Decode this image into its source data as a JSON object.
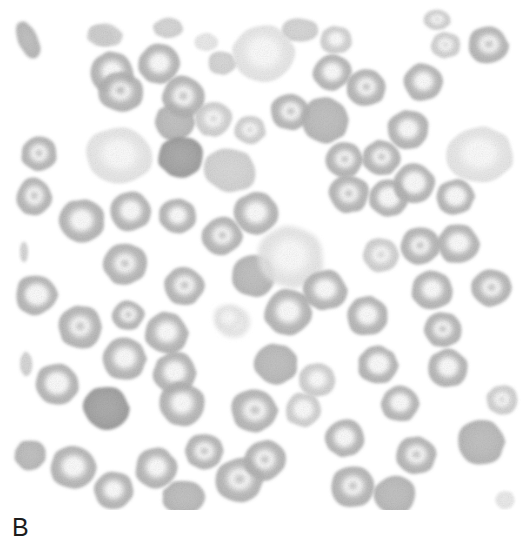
{
  "figure": {
    "panel_label": "B",
    "image_kind": "blood-smear-micrograph",
    "background_color": "#ffffff",
    "canvas": {
      "width": 530,
      "height": 510
    },
    "label_color": "#1c1c1c",
    "alt_text": "B"
  },
  "palette": {
    "background": "#ffffff",
    "cell_dark": "#9a9a9a",
    "cell_mid": "#b4b4b4",
    "cell_light": "#cfcfcf",
    "cell_pale": "#e6e6e6",
    "pallor_center": "#fbfbfb",
    "rim_shadow": "#8f8f8f"
  },
  "cells": [
    {
      "cx": 28,
      "cy": 40,
      "rx": 10,
      "ry": 20,
      "rot": -25,
      "tone": "mid",
      "pallor": 0.05,
      "kind": "fragment"
    },
    {
      "cx": 101,
      "cy": 36,
      "rx": 14,
      "ry": 10,
      "rot": 10,
      "tone": "light",
      "pallor": 0.1,
      "kind": "fragment"
    },
    {
      "cx": 112,
      "cy": 72,
      "rx": 22,
      "ry": 21,
      "rot": 0,
      "tone": "mid",
      "pallor": 0.6,
      "kind": "discocyte"
    },
    {
      "cx": 119,
      "cy": 156,
      "rx": 33,
      "ry": 28,
      "rot": 8,
      "tone": "pale",
      "pallor": 0.82,
      "kind": "hypochromic"
    },
    {
      "cx": 39,
      "cy": 154,
      "rx": 18,
      "ry": 17,
      "rot": 0,
      "tone": "mid",
      "pallor": 0.55,
      "kind": "discocyte"
    },
    {
      "cx": 34,
      "cy": 197,
      "rx": 18,
      "ry": 19,
      "rot": 0,
      "tone": "mid",
      "pallor": 0.55,
      "kind": "discocyte"
    },
    {
      "cx": 82,
      "cy": 221,
      "rx": 23,
      "ry": 22,
      "rot": 0,
      "tone": "mid",
      "pallor": 0.72,
      "kind": "discocyte"
    },
    {
      "cx": 130,
      "cy": 211,
      "rx": 21,
      "ry": 20,
      "rot": 0,
      "tone": "mid",
      "pallor": 0.7,
      "kind": "discocyte"
    },
    {
      "cx": 178,
      "cy": 216,
      "rx": 19,
      "ry": 18,
      "rot": 0,
      "tone": "mid",
      "pallor": 0.58,
      "kind": "discocyte"
    },
    {
      "cx": 125,
      "cy": 264,
      "rx": 22,
      "ry": 21,
      "rot": 0,
      "tone": "mid",
      "pallor": 0.45,
      "kind": "discocyte"
    },
    {
      "cx": 36,
      "cy": 295,
      "rx": 21,
      "ry": 20,
      "rot": 0,
      "tone": "mid",
      "pallor": 0.8,
      "kind": "annulocyte"
    },
    {
      "cx": 80,
      "cy": 327,
      "rx": 22,
      "ry": 22,
      "rot": 0,
      "tone": "mid",
      "pallor": 0.5,
      "kind": "discocyte"
    },
    {
      "cx": 128,
      "cy": 315,
      "rx": 16,
      "ry": 15,
      "rot": 0,
      "tone": "mid",
      "pallor": 0.52,
      "kind": "keratocyte"
    },
    {
      "cx": 24,
      "cy": 252,
      "rx": 4,
      "ry": 10,
      "rot": 0,
      "tone": "light",
      "pallor": 0.05,
      "kind": "fragment"
    },
    {
      "cx": 124,
      "cy": 359,
      "rx": 22,
      "ry": 21,
      "rot": 0,
      "tone": "mid",
      "pallor": 0.65,
      "kind": "discocyte"
    },
    {
      "cx": 175,
      "cy": 373,
      "rx": 22,
      "ry": 21,
      "rot": 0,
      "tone": "mid",
      "pallor": 0.62,
      "kind": "discocyte"
    },
    {
      "cx": 26,
      "cy": 364,
      "rx": 6,
      "ry": 12,
      "rot": 0,
      "tone": "light",
      "pallor": 0.05,
      "kind": "fragment"
    },
    {
      "cx": 57,
      "cy": 384,
      "rx": 22,
      "ry": 21,
      "rot": 0,
      "tone": "mid",
      "pallor": 0.82,
      "kind": "annulocyte"
    },
    {
      "cx": 106,
      "cy": 408,
      "rx": 23,
      "ry": 22,
      "rot": 0,
      "tone": "dark",
      "pallor": 0.18,
      "kind": "discocyte"
    },
    {
      "cx": 30,
      "cy": 455,
      "rx": 16,
      "ry": 15,
      "rot": 0,
      "tone": "mid",
      "pallor": 0.3,
      "kind": "fragment"
    },
    {
      "cx": 73,
      "cy": 467,
      "rx": 23,
      "ry": 22,
      "rot": 0,
      "tone": "mid",
      "pallor": 0.7,
      "kind": "discocyte"
    },
    {
      "cx": 114,
      "cy": 490,
      "rx": 20,
      "ry": 19,
      "rot": 0,
      "tone": "mid",
      "pallor": 0.58,
      "kind": "discocyte"
    },
    {
      "cx": 156,
      "cy": 468,
      "rx": 21,
      "ry": 20,
      "rot": 0,
      "tone": "mid",
      "pallor": 0.6,
      "kind": "discocyte"
    },
    {
      "cx": 121,
      "cy": 92,
      "rx": 23,
      "ry": 20,
      "rot": 0,
      "tone": "mid",
      "pallor": 0.48,
      "kind": "discocyte"
    },
    {
      "cx": 175,
      "cy": 122,
      "rx": 20,
      "ry": 19,
      "rot": 0,
      "tone": "mid",
      "pallor": 0.35,
      "kind": "discocyte"
    },
    {
      "cx": 106,
      "cy": 35,
      "rx": 17,
      "ry": 11,
      "rot": 12,
      "tone": "light",
      "pallor": 0.08,
      "kind": "fragment"
    },
    {
      "cx": 159,
      "cy": 64,
      "rx": 21,
      "ry": 20,
      "rot": 0,
      "tone": "mid",
      "pallor": 0.62,
      "kind": "discocyte"
    },
    {
      "cx": 184,
      "cy": 97,
      "rx": 22,
      "ry": 21,
      "rot": 0,
      "tone": "mid",
      "pallor": 0.5,
      "kind": "discocyte"
    },
    {
      "cx": 213,
      "cy": 119,
      "rx": 19,
      "ry": 18,
      "rot": 0,
      "tone": "light",
      "pallor": 0.45,
      "kind": "discocyte"
    },
    {
      "cx": 181,
      "cy": 157,
      "rx": 23,
      "ry": 21,
      "rot": 0,
      "tone": "dark",
      "pallor": 0.2,
      "kind": "discocyte"
    },
    {
      "cx": 230,
      "cy": 170,
      "rx": 26,
      "ry": 22,
      "rot": 12,
      "tone": "light",
      "pallor": 0.35,
      "kind": "macrocyte"
    },
    {
      "cx": 222,
      "cy": 63,
      "rx": 14,
      "ry": 12,
      "rot": 0,
      "tone": "light",
      "pallor": 0.25,
      "kind": "fragment"
    },
    {
      "cx": 206,
      "cy": 42,
      "rx": 12,
      "ry": 9,
      "rot": 0,
      "tone": "pale",
      "pallor": 0.15,
      "kind": "fragment"
    },
    {
      "cx": 222,
      "cy": 236,
      "rx": 20,
      "ry": 19,
      "rot": 0,
      "tone": "mid",
      "pallor": 0.42,
      "kind": "discocyte"
    },
    {
      "cx": 253,
      "cy": 276,
      "rx": 22,
      "ry": 21,
      "rot": 0,
      "tone": "mid",
      "pallor": 0.28,
      "kind": "discocyte"
    },
    {
      "cx": 184,
      "cy": 286,
      "rx": 20,
      "ry": 19,
      "rot": 0,
      "tone": "mid",
      "pallor": 0.55,
      "kind": "discocyte"
    },
    {
      "cx": 233,
      "cy": 322,
      "rx": 17,
      "ry": 15,
      "rot": 0,
      "tone": "pale",
      "pallor": 0.85,
      "kind": "ghost"
    },
    {
      "cx": 166,
      "cy": 333,
      "rx": 22,
      "ry": 21,
      "rot": 0,
      "tone": "mid",
      "pallor": 0.6,
      "kind": "discocyte"
    },
    {
      "cx": 182,
      "cy": 404,
      "rx": 23,
      "ry": 22,
      "rot": 0,
      "tone": "mid",
      "pallor": 0.58,
      "kind": "discocyte"
    },
    {
      "cx": 204,
      "cy": 451,
      "rx": 19,
      "ry": 18,
      "rot": 0,
      "tone": "mid",
      "pallor": 0.55,
      "kind": "discocyte"
    },
    {
      "cx": 184,
      "cy": 497,
      "rx": 22,
      "ry": 17,
      "rot": 0,
      "tone": "mid",
      "pallor": 0.35,
      "kind": "discocyte"
    },
    {
      "cx": 239,
      "cy": 480,
      "rx": 24,
      "ry": 22,
      "rot": 0,
      "tone": "mid",
      "pallor": 0.55,
      "kind": "discocyte"
    },
    {
      "cx": 264,
      "cy": 53,
      "rx": 32,
      "ry": 28,
      "rot": 10,
      "tone": "pale",
      "pallor": 0.88,
      "kind": "hypochromic"
    },
    {
      "cx": 290,
      "cy": 112,
      "rx": 20,
      "ry": 18,
      "rot": 0,
      "tone": "mid",
      "pallor": 0.55,
      "kind": "discocyte"
    },
    {
      "cx": 250,
      "cy": 130,
      "rx": 16,
      "ry": 14,
      "rot": 0,
      "tone": "light",
      "pallor": 0.45,
      "kind": "fragment"
    },
    {
      "cx": 256,
      "cy": 213,
      "rx": 22,
      "ry": 21,
      "rot": 0,
      "tone": "mid",
      "pallor": 0.65,
      "kind": "discocyte"
    },
    {
      "cx": 290,
      "cy": 257,
      "rx": 34,
      "ry": 31,
      "rot": 0,
      "tone": "pale",
      "pallor": 0.92,
      "kind": "ghost"
    },
    {
      "cx": 288,
      "cy": 312,
      "rx": 24,
      "ry": 23,
      "rot": 0,
      "tone": "mid",
      "pallor": 0.62,
      "kind": "discocyte"
    },
    {
      "cx": 276,
      "cy": 364,
      "rx": 22,
      "ry": 20,
      "rot": 0,
      "tone": "mid",
      "pallor": 0.25,
      "kind": "discocyte"
    },
    {
      "cx": 303,
      "cy": 410,
      "rx": 18,
      "ry": 17,
      "rot": 0,
      "tone": "light",
      "pallor": 0.7,
      "kind": "annulocyte"
    },
    {
      "cx": 254,
      "cy": 410,
      "rx": 23,
      "ry": 22,
      "rot": 0,
      "tone": "mid",
      "pallor": 0.55,
      "kind": "discocyte"
    },
    {
      "cx": 265,
      "cy": 460,
      "rx": 21,
      "ry": 20,
      "rot": 0,
      "tone": "mid",
      "pallor": 0.5,
      "kind": "discocyte"
    },
    {
      "cx": 228,
      "cy": 318,
      "rx": 14,
      "ry": 13,
      "rot": 0,
      "tone": "pale",
      "pallor": 0.9,
      "kind": "ghost"
    },
    {
      "cx": 325,
      "cy": 120,
      "rx": 24,
      "ry": 23,
      "rot": 0,
      "tone": "mid",
      "pallor": 0.3,
      "kind": "discocyte"
    },
    {
      "cx": 332,
      "cy": 72,
      "rx": 19,
      "ry": 18,
      "rot": 0,
      "tone": "mid",
      "pallor": 0.6,
      "kind": "discocyte"
    },
    {
      "cx": 366,
      "cy": 88,
      "rx": 20,
      "ry": 19,
      "rot": 0,
      "tone": "mid",
      "pallor": 0.55,
      "kind": "discocyte"
    },
    {
      "cx": 344,
      "cy": 160,
      "rx": 19,
      "ry": 18,
      "rot": 0,
      "tone": "mid",
      "pallor": 0.48,
      "kind": "discocyte"
    },
    {
      "cx": 349,
      "cy": 194,
      "rx": 20,
      "ry": 19,
      "rot": 0,
      "tone": "mid",
      "pallor": 0.52,
      "kind": "discocyte"
    },
    {
      "cx": 381,
      "cy": 158,
      "rx": 19,
      "ry": 18,
      "rot": 0,
      "tone": "mid",
      "pallor": 0.5,
      "kind": "discocyte"
    },
    {
      "cx": 336,
      "cy": 40,
      "rx": 16,
      "ry": 14,
      "rot": 0,
      "tone": "light",
      "pallor": 0.6,
      "kind": "fragment"
    },
    {
      "cx": 325,
      "cy": 290,
      "rx": 22,
      "ry": 20,
      "rot": 0,
      "tone": "mid",
      "pallor": 0.62,
      "kind": "discocyte"
    },
    {
      "cx": 367,
      "cy": 316,
      "rx": 21,
      "ry": 20,
      "rot": 0,
      "tone": "mid",
      "pallor": 0.7,
      "kind": "discocyte"
    },
    {
      "cx": 317,
      "cy": 380,
      "rx": 18,
      "ry": 17,
      "rot": 0,
      "tone": "light",
      "pallor": 0.6,
      "kind": "fragment"
    },
    {
      "cx": 345,
      "cy": 438,
      "rx": 20,
      "ry": 19,
      "rot": 0,
      "tone": "mid",
      "pallor": 0.68,
      "kind": "discocyte"
    },
    {
      "cx": 352,
      "cy": 487,
      "rx": 22,
      "ry": 21,
      "rot": 0,
      "tone": "mid",
      "pallor": 0.5,
      "kind": "discocyte"
    },
    {
      "cx": 389,
      "cy": 198,
      "rx": 20,
      "ry": 19,
      "rot": 0,
      "tone": "mid",
      "pallor": 0.8,
      "kind": "annulocyte"
    },
    {
      "cx": 381,
      "cy": 255,
      "rx": 18,
      "ry": 17,
      "rot": 0,
      "tone": "light",
      "pallor": 0.55,
      "kind": "discocyte"
    },
    {
      "cx": 408,
      "cy": 130,
      "rx": 21,
      "ry": 20,
      "rot": 0,
      "tone": "mid",
      "pallor": 0.62,
      "kind": "discocyte"
    },
    {
      "cx": 423,
      "cy": 82,
      "rx": 20,
      "ry": 19,
      "rot": 0,
      "tone": "mid",
      "pallor": 0.6,
      "kind": "discocyte"
    },
    {
      "cx": 446,
      "cy": 45,
      "rx": 15,
      "ry": 13,
      "rot": 0,
      "tone": "light",
      "pallor": 0.5,
      "kind": "fragment"
    },
    {
      "cx": 414,
      "cy": 184,
      "rx": 21,
      "ry": 20,
      "rot": 0,
      "tone": "mid",
      "pallor": 0.78,
      "kind": "annulocyte"
    },
    {
      "cx": 455,
      "cy": 197,
      "rx": 19,
      "ry": 18,
      "rot": 0,
      "tone": "mid",
      "pallor": 0.8,
      "kind": "annulocyte"
    },
    {
      "cx": 480,
      "cy": 155,
      "rx": 33,
      "ry": 29,
      "rot": 0,
      "tone": "pale",
      "pallor": 0.88,
      "kind": "hypochromic"
    },
    {
      "cx": 488,
      "cy": 45,
      "rx": 20,
      "ry": 19,
      "rot": 0,
      "tone": "mid",
      "pallor": 0.55,
      "kind": "discocyte"
    },
    {
      "cx": 420,
      "cy": 246,
      "rx": 20,
      "ry": 19,
      "rot": 0,
      "tone": "mid",
      "pallor": 0.5,
      "kind": "discocyte"
    },
    {
      "cx": 458,
      "cy": 244,
      "rx": 21,
      "ry": 20,
      "rot": 0,
      "tone": "mid",
      "pallor": 0.68,
      "kind": "discocyte"
    },
    {
      "cx": 432,
      "cy": 290,
      "rx": 21,
      "ry": 20,
      "rot": 0,
      "tone": "mid",
      "pallor": 0.6,
      "kind": "discocyte"
    },
    {
      "cx": 491,
      "cy": 288,
      "rx": 20,
      "ry": 19,
      "rot": 0,
      "tone": "mid",
      "pallor": 0.48,
      "kind": "discocyte"
    },
    {
      "cx": 443,
      "cy": 330,
      "rx": 19,
      "ry": 18,
      "rot": 0,
      "tone": "mid",
      "pallor": 0.5,
      "kind": "discocyte"
    },
    {
      "cx": 378,
      "cy": 365,
      "rx": 20,
      "ry": 19,
      "rot": 0,
      "tone": "mid",
      "pallor": 0.72,
      "kind": "annulocyte"
    },
    {
      "cx": 448,
      "cy": 368,
      "rx": 20,
      "ry": 19,
      "rot": 0,
      "tone": "mid",
      "pallor": 0.68,
      "kind": "discocyte"
    },
    {
      "cx": 400,
      "cy": 404,
      "rx": 19,
      "ry": 18,
      "rot": 0,
      "tone": "mid",
      "pallor": 0.72,
      "kind": "discocyte"
    },
    {
      "cx": 502,
      "cy": 400,
      "rx": 16,
      "ry": 15,
      "rot": 0,
      "tone": "light",
      "pallor": 0.5,
      "kind": "fragment"
    },
    {
      "cx": 416,
      "cy": 455,
      "rx": 20,
      "ry": 19,
      "rot": 0,
      "tone": "mid",
      "pallor": 0.55,
      "kind": "discocyte"
    },
    {
      "cx": 395,
      "cy": 495,
      "rx": 21,
      "ry": 20,
      "rot": 0,
      "tone": "mid",
      "pallor": 0.35,
      "kind": "discocyte"
    },
    {
      "cx": 481,
      "cy": 442,
      "rx": 24,
      "ry": 23,
      "rot": 0,
      "tone": "mid",
      "pallor": 0.2,
      "kind": "discocyte"
    },
    {
      "cx": 505,
      "cy": 500,
      "rx": 10,
      "ry": 9,
      "rot": 0,
      "tone": "pale",
      "pallor": 0.3,
      "kind": "fragment"
    },
    {
      "cx": 300,
      "cy": 30,
      "rx": 18,
      "ry": 12,
      "rot": 0,
      "tone": "light",
      "pallor": 0.3,
      "kind": "fragment"
    },
    {
      "cx": 437,
      "cy": 20,
      "rx": 14,
      "ry": 10,
      "rot": 0,
      "tone": "light",
      "pallor": 0.4,
      "kind": "fragment"
    },
    {
      "cx": 168,
      "cy": 28,
      "rx": 15,
      "ry": 10,
      "rot": 0,
      "tone": "light",
      "pallor": 0.2,
      "kind": "fragment"
    }
  ]
}
